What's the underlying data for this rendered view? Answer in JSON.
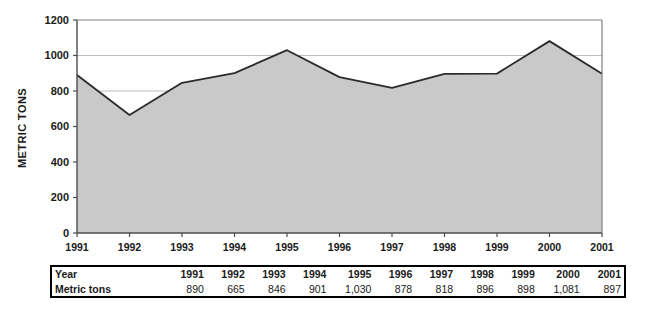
{
  "chart_data": {
    "type": "area",
    "title": "",
    "xlabel": "",
    "ylabel": "METRIC TONS",
    "categories": [
      "1991",
      "1992",
      "1993",
      "1994",
      "1995",
      "1996",
      "1997",
      "1998",
      "1999",
      "2000",
      "2001"
    ],
    "values": [
      890,
      665,
      846,
      901,
      1030,
      878,
      818,
      896,
      898,
      1081,
      897
    ],
    "ylim": [
      0,
      1200
    ],
    "ytick_labels": [
      "0",
      "200",
      "400",
      "600",
      "800",
      "1000",
      "1200"
    ],
    "ytick_values": [
      0,
      200,
      400,
      600,
      800,
      1000,
      1200
    ],
    "grid": true,
    "legend": "none",
    "series": [
      {
        "name": "Metric tons",
        "values": [
          890,
          665,
          846,
          901,
          1030,
          878,
          818,
          896,
          898,
          1081,
          897
        ]
      }
    ],
    "colors": {
      "area_fill": "#c9c9c9",
      "area_line": "#2b2b2b",
      "axis": "#4d4d4d",
      "grid": "#b5b5b5",
      "background": "#ffffff"
    }
  },
  "table": {
    "row_labels": {
      "year": "Year",
      "metric_tons": "Metric tons"
    },
    "years": [
      "1991",
      "1992",
      "1993",
      "1994",
      "1995",
      "1996",
      "1997",
      "1998",
      "1999",
      "2000",
      "2001"
    ],
    "values": [
      "890",
      "665",
      "846",
      "901",
      "1,030",
      "878",
      "818",
      "896",
      "898",
      "1,081",
      "897"
    ]
  }
}
